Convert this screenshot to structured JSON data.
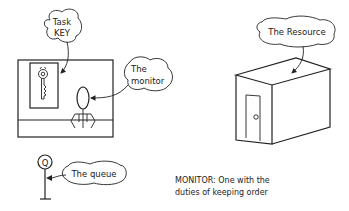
{
  "diagram": {
    "callouts": {
      "task_key_line1": "Task",
      "task_key_line2": "KEY",
      "monitor_line1": "The",
      "monitor_line2": "monitor",
      "resource": "The Resource",
      "queue": "The queue",
      "queue_symbol": "Q"
    },
    "caption": {
      "line1": "MONITOR: One with the",
      "line2": "duties of keeping order"
    },
    "colors": {
      "ink": "#222222",
      "background": "#ffffff"
    }
  }
}
